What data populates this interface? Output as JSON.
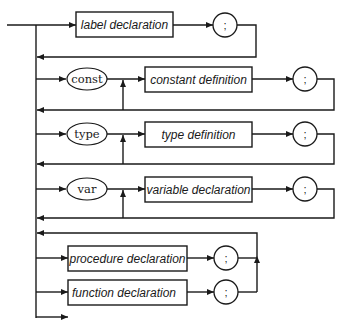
{
  "diagram": {
    "title_fragment": "",
    "rows": [
      {
        "id": "label",
        "keyword": null,
        "nonterminal": "label declaration",
        "terminator": ";"
      },
      {
        "id": "const",
        "keyword": "const",
        "nonterminal": "constant definition",
        "terminator": ";"
      },
      {
        "id": "type",
        "keyword": "type",
        "nonterminal": "type definition",
        "terminator": ";"
      },
      {
        "id": "var",
        "keyword": "var",
        "nonterminal": "variable declaration",
        "terminator": ";"
      },
      {
        "id": "procedure",
        "keyword": null,
        "nonterminal": "procedure declaration",
        "terminator": ";"
      },
      {
        "id": "function",
        "keyword": null,
        "nonterminal": "function declaration",
        "terminator": ";"
      }
    ],
    "colors": {
      "stroke": "#1a1a1a",
      "background": "#ffffff"
    }
  }
}
